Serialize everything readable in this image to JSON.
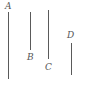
{
  "diagram": {
    "type": "line-segments",
    "segments": [
      {
        "id": "A",
        "label": "A",
        "label_position": "top",
        "x": 8,
        "y1": 12,
        "y2": 79
      },
      {
        "id": "B",
        "label": "B",
        "label_position": "bottom",
        "x": 30,
        "y1": 12,
        "y2": 50
      },
      {
        "id": "C",
        "label": "C",
        "label_position": "bottom",
        "x": 48,
        "y1": 10,
        "y2": 59
      },
      {
        "id": "D",
        "label": "D",
        "label_position": "top",
        "x": 71,
        "y1": 43,
        "y2": 75
      }
    ],
    "colors": {
      "line": "#5a5a5a",
      "label": "#555555",
      "background": "#ffffff"
    }
  }
}
